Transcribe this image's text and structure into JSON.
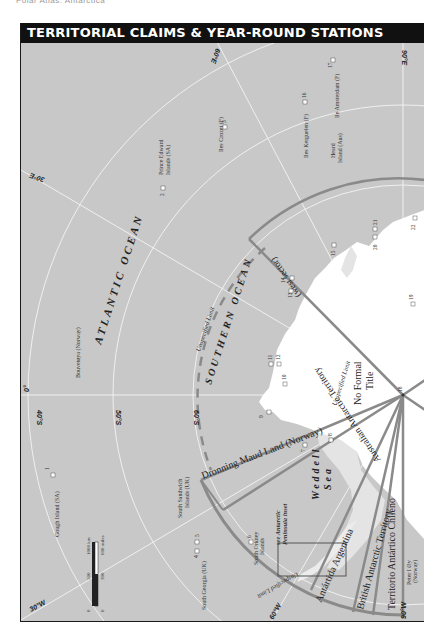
{
  "page": {
    "header": "Polar Atlas: Antarctica"
  },
  "map": {
    "title": "TERRITORIAL CLAIMS & YEAR-ROUND STATIONS",
    "colors": {
      "sea": "#c8c8c8",
      "land": "#ffffff",
      "ice_shelf": "#e4e4e4",
      "grid": "#f2f2f2",
      "claim_line": "#8a8a8a",
      "title_bg": "#111111"
    },
    "oceans": {
      "atlantic": "ATLANTIC OCEAN",
      "southern": "SOUTHERN OCEAN",
      "weddell_1": "Weddell",
      "weddell_2": "Sea"
    },
    "grid_labels": {
      "lon_0": "0°",
      "lon_30e": "30°E",
      "lon_60e": "60°E",
      "lon_90e": "90°E",
      "lon_30w": "30°W",
      "lon_60w": "60°W",
      "lon_90w": "90°W",
      "lat_40s": "40°S",
      "lat_50s": "50°S",
      "lat_60s": "60°S"
    },
    "claims": {
      "australian": "Australian Antarctic Territory",
      "australian_sector": "(west sector)",
      "dronning_maud": "Dronning Maud Land (Norway)",
      "no_formal_1": "No Formal",
      "no_formal_2": "Title",
      "argentina": "Antártida Argentina",
      "british": "British Antarctic Territory",
      "chile": "Territorio Antártico Chileno",
      "unspecified_limit": "Unspecified Limit"
    },
    "islands": {
      "gough": "Gough Island (SA)",
      "bouvetoya": "Bouvetøya (Norway)",
      "prince_edward_1": "Prince Edward",
      "prince_edward_2": "Islands (SA)",
      "crozet": "Iles Crozet (F)",
      "kerguelen": "Iles Kerguelen (F)",
      "heard_1": "Heard",
      "heard_2": "Island (Aus)",
      "amsterdam": "Ile Amsterdam (F)",
      "south_sandwich_1": "South Sandwich",
      "south_sandwich_2": "Islands (UK)",
      "south_georgia": "South Georgia (UK)",
      "south_orkney_1": "South Orkney",
      "south_orkney_2": "Islands",
      "peter_1": "Peter I Øy",
      "peter_2": "(Norway)"
    },
    "inset_note": {
      "line1": "see Antarctic",
      "line2": "Peninsula inset"
    },
    "scale": {
      "km_0": "0",
      "km_500": "500",
      "km_1000": "1000 km",
      "mi_0": "0",
      "mi_300": "300",
      "mi_600": "600 miles"
    },
    "stations": [
      {
        "id": "1",
        "label": "1"
      },
      {
        "id": "2",
        "label": "2"
      },
      {
        "id": "3",
        "label": "3"
      },
      {
        "id": "4",
        "label": "4"
      },
      {
        "id": "5",
        "label": "5"
      },
      {
        "id": "6",
        "label": "6"
      },
      {
        "id": "7",
        "label": "7"
      },
      {
        "id": "8",
        "label": "8"
      },
      {
        "id": "9",
        "label": "9"
      },
      {
        "id": "10",
        "label": "10"
      },
      {
        "id": "11",
        "label": "11"
      },
      {
        "id": "12",
        "label": "12"
      },
      {
        "id": "13",
        "label": "13"
      },
      {
        "id": "14",
        "label": "14"
      },
      {
        "id": "15",
        "label": "15"
      },
      {
        "id": "16",
        "label": "16"
      },
      {
        "id": "17",
        "label": "17"
      },
      {
        "id": "18",
        "label": "18"
      },
      {
        "id": "19",
        "label": "19"
      },
      {
        "id": "20",
        "label": "20"
      },
      {
        "id": "21",
        "label": "21"
      },
      {
        "id": "22",
        "label": "22"
      }
    ]
  }
}
